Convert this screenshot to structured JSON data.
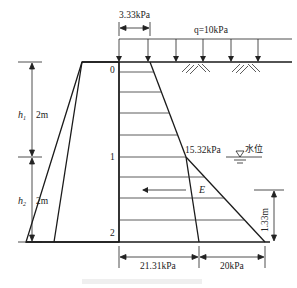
{
  "figure": {
    "caption": "",
    "surcharge": {
      "label": "q=10kPa",
      "arrow_count": 6
    },
    "top_pressure": {
      "label": "3.33kPa",
      "value_kpa": 3.33
    },
    "point1_pressure": {
      "label": "15.32kPa",
      "value_kpa": 15.32
    },
    "bottom_earth_pressure": {
      "label": "21.31kPa",
      "value_kpa": 21.31
    },
    "bottom_water_pressure": {
      "label": "20kPa",
      "value_kpa": 20
    },
    "resultant": {
      "label": "E",
      "height_label": "1.33m",
      "height_m": 1.33
    },
    "water_level": {
      "label": "水位"
    },
    "layers": [
      {
        "symbol": "h",
        "subscript": "1",
        "thickness_label": "2m",
        "thickness_m": 2
      },
      {
        "symbol": "h",
        "subscript": "2",
        "thickness_label": "2m",
        "thickness_m": 2
      }
    ],
    "points": [
      "0",
      "1",
      "2"
    ],
    "colors": {
      "line": "#1a1a1a",
      "thin": "#333333"
    }
  }
}
